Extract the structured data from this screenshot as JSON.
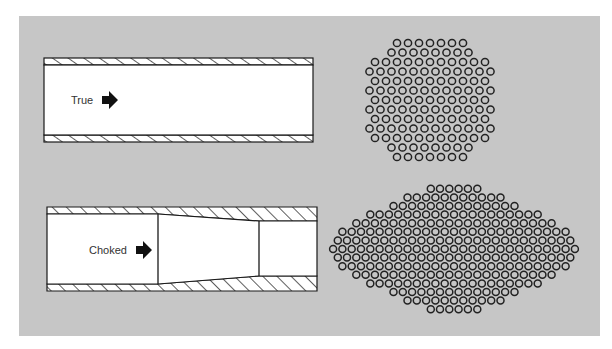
{
  "canvas": {
    "width": 612,
    "height": 349,
    "background": "#ffffff"
  },
  "panel": {
    "x": 19,
    "y": 16,
    "width": 581,
    "height": 320,
    "color": "#c6c6c6"
  },
  "colors": {
    "pipe_fill": "#ffffff",
    "stroke": "#1a1a1a",
    "text": "#333333",
    "circle": "#222222"
  },
  "pipes": {
    "true": {
      "label": "True",
      "x1": 44,
      "x2": 313,
      "outer_top": 58,
      "inner_top": 65,
      "inner_bottom": 135,
      "outer_bottom": 142,
      "label_x": 71,
      "label_y": 104,
      "arrow_x": 102,
      "arrow_y": 100
    },
    "choked": {
      "label": "Choked",
      "x1": 47,
      "x2": 317,
      "outer_top": 207,
      "outer_bottom": 291,
      "inner_top_wide": 214,
      "inner_bottom_wide": 284,
      "inner_top_narrow": 221,
      "inner_bottom_narrow": 276,
      "taper_start": 158,
      "taper_end": 259,
      "label_x": 89,
      "label_y": 254,
      "arrow_x": 136,
      "arrow_y": 250
    }
  },
  "clusters": [
    {
      "name": "true-flow-particles",
      "shape": "octagon",
      "cx": 430,
      "cy": 100,
      "rx": 69,
      "ry": 70,
      "spacing_x": 11,
      "spacing_y": 9.5,
      "radius": 3.6
    },
    {
      "name": "choked-flow-particles",
      "shape": "lens",
      "cx": 454,
      "cy": 249,
      "rx": 133,
      "ry": 72,
      "spacing_x": 9.3,
      "spacing_y": 8.6,
      "radius": 3.5
    }
  ]
}
